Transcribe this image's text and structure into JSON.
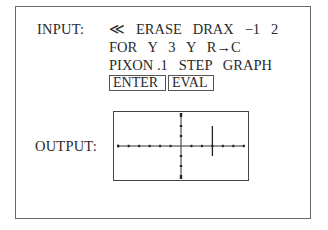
{
  "input": {
    "label": "INPUT:",
    "lines": [
      "≪   ERASE   DRAX   −1   2",
      "FOR   Y   3   Y   R→C",
      "PIXON .1   STEP   GRAPH"
    ],
    "keys": [
      "ENTER",
      "EVAL"
    ]
  },
  "output": {
    "label": "OUTPUT:",
    "graph": {
      "description": "Calculator display showing x and y axes with tick marks and a vertical line segment",
      "x_range": [
        -6.5,
        6.5
      ],
      "y_range": [
        -3.5,
        3.5
      ],
      "x_ticks": [
        -6,
        -5,
        -4,
        -3,
        -2,
        -1,
        1,
        2,
        3,
        4,
        5,
        6
      ],
      "y_ticks": [
        -3,
        -2,
        -1,
        1,
        2,
        3
      ],
      "segment": {
        "x": 3,
        "y_from": -1,
        "y_to": 2
      }
    }
  }
}
